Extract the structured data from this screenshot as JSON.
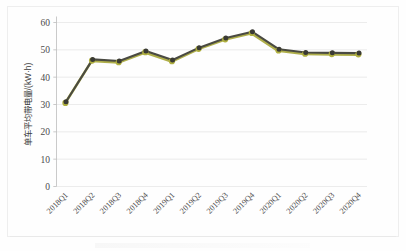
{
  "chart_data": {
    "type": "line",
    "title": "",
    "subtitle": "",
    "xlabel": "",
    "ylabel": "单车平均带电量/(kW·h)",
    "categories": [
      "2018Q1",
      "2018Q2",
      "2018Q3",
      "2018Q4",
      "2019Q1",
      "2019Q2",
      "2019Q3",
      "2019Q4",
      "2020Q1",
      "2020Q2",
      "2020Q3",
      "2020Q4"
    ],
    "values": [
      31.0,
      46.5,
      45.9,
      49.6,
      46.3,
      50.8,
      54.3,
      56.6,
      50.2,
      49.0,
      48.9,
      48.8
    ],
    "series": [
      {
        "name": "单车平均带电量",
        "values": [
          31.0,
          46.5,
          45.9,
          49.6,
          46.3,
          50.8,
          54.3,
          56.6,
          50.2,
          49.0,
          48.9,
          48.8
        ]
      }
    ],
    "ylim": [
      0,
      60
    ],
    "yticks": [
      0,
      10,
      20,
      30,
      40,
      50,
      60
    ],
    "ytick_labels": [
      "0",
      "10",
      "20",
      "30",
      "40",
      "50",
      "60"
    ],
    "grid": true,
    "grid_axis": "y",
    "legend": false,
    "legend_position": "none",
    "marker": "circle",
    "line_color": "#4a4a42",
    "shadow_color": "#a8a83c",
    "marker_fill": "#3a3a34",
    "marker_edge": "#b0b040",
    "gridline_color": "#e4e4e4",
    "axis_color": "#bdbdbd",
    "background_color": "#fefefe",
    "text_color": "#4a4a4a",
    "xtick_rotation": -45
  },
  "axis": {
    "y_title": "单车平均带电量/(kW·h)"
  }
}
